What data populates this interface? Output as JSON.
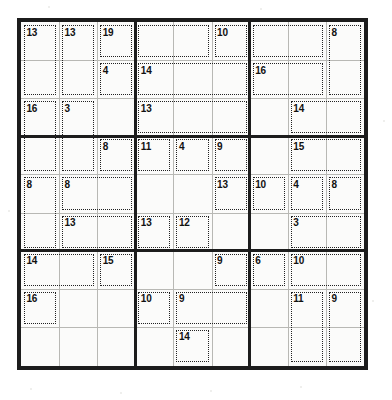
{
  "puzzle": {
    "type": "killer-sudoku",
    "title": "Killer Sudoku",
    "grid_size": 9,
    "box_size": 3,
    "cells_filled": [],
    "geometry": {
      "origin_x": 17,
      "origin_y": 18,
      "grid_px": 351,
      "cell_px": 38.6
    },
    "colors": {
      "border": "#1c1c1c",
      "cell_line": "#b8b8b4",
      "cage_line": "#222222",
      "paper": "#fbfbfa",
      "text": "#111111"
    },
    "cages": [
      {
        "sum": "13",
        "anchor": [
          0,
          0
        ],
        "cells": [
          [
            0,
            0
          ],
          [
            1,
            0
          ]
        ]
      },
      {
        "sum": "13",
        "anchor": [
          0,
          1
        ],
        "cells": [
          [
            0,
            1
          ],
          [
            1,
            1
          ]
        ]
      },
      {
        "sum": "19",
        "anchor": [
          0,
          2
        ],
        "cells": [
          [
            0,
            2
          ]
        ]
      },
      {
        "sum": "10",
        "anchor": [
          0,
          5
        ],
        "cells": [
          [
            0,
            5
          ],
          [
            0,
            6
          ],
          [
            0,
            7
          ]
        ]
      },
      {
        "sum": "8",
        "anchor": [
          0,
          8
        ],
        "cells": [
          [
            0,
            8
          ],
          [
            1,
            8
          ]
        ]
      },
      {
        "sum": "4",
        "anchor": [
          1,
          2
        ],
        "cells": [
          [
            1,
            2
          ],
          [
            1,
            3
          ],
          [
            1,
            4
          ]
        ]
      },
      {
        "sum": "14",
        "anchor": [
          1,
          3
        ],
        "cells": [
          [
            1,
            3
          ],
          [
            1,
            4
          ],
          [
            1,
            5
          ]
        ]
      },
      {
        "sum": "16",
        "anchor": [
          1,
          6
        ],
        "cells": [
          [
            1,
            6
          ],
          [
            1,
            7
          ],
          [
            2,
            6
          ]
        ]
      },
      {
        "sum": "16",
        "anchor": [
          2,
          0
        ],
        "cells": [
          [
            2,
            0
          ],
          [
            3,
            0
          ]
        ]
      },
      {
        "sum": "3",
        "anchor": [
          2,
          1
        ],
        "cells": [
          [
            2,
            1
          ],
          [
            3,
            1
          ]
        ]
      },
      {
        "sum": "13",
        "anchor": [
          2,
          3
        ],
        "cells": [
          [
            2,
            3
          ],
          [
            2,
            4
          ],
          [
            2,
            5
          ]
        ]
      },
      {
        "sum": "14",
        "anchor": [
          2,
          7
        ],
        "cells": [
          [
            2,
            7
          ],
          [
            2,
            8
          ]
        ]
      },
      {
        "sum": "8",
        "anchor": [
          3,
          2
        ],
        "cells": [
          [
            3,
            2
          ]
        ]
      },
      {
        "sum": "11",
        "anchor": [
          3,
          3
        ],
        "cells": [
          [
            3,
            3
          ],
          [
            3,
            4
          ]
        ]
      },
      {
        "sum": "4",
        "anchor": [
          3,
          4
        ],
        "cells": [
          [
            3,
            4
          ]
        ]
      },
      {
        "sum": "9",
        "anchor": [
          3,
          5
        ],
        "cells": [
          [
            3,
            5
          ],
          [
            3,
            6
          ]
        ]
      },
      {
        "sum": "15",
        "anchor": [
          3,
          7
        ],
        "cells": [
          [
            3,
            7
          ],
          [
            3,
            8
          ]
        ]
      },
      {
        "sum": "8",
        "anchor": [
          4,
          0
        ],
        "cells": [
          [
            4,
            0
          ],
          [
            5,
            0
          ]
        ]
      },
      {
        "sum": "8",
        "anchor": [
          4,
          1
        ],
        "cells": [
          [
            4,
            1
          ],
          [
            4,
            2
          ]
        ]
      },
      {
        "sum": "13",
        "anchor": [
          4,
          5
        ],
        "cells": [
          [
            4,
            5
          ],
          [
            5,
            5
          ]
        ]
      },
      {
        "sum": "10",
        "anchor": [
          4,
          6
        ],
        "cells": [
          [
            4,
            6
          ],
          [
            5,
            6
          ]
        ]
      },
      {
        "sum": "4",
        "anchor": [
          4,
          7
        ],
        "cells": [
          [
            4,
            7
          ]
        ]
      },
      {
        "sum": "8",
        "anchor": [
          4,
          8
        ],
        "cells": [
          [
            4,
            8
          ]
        ]
      },
      {
        "sum": "13",
        "anchor": [
          5,
          1
        ],
        "cells": [
          [
            5,
            1
          ],
          [
            5,
            2
          ]
        ]
      },
      {
        "sum": "13",
        "anchor": [
          5,
          3
        ],
        "cells": [
          [
            5,
            3
          ],
          [
            5,
            4
          ]
        ]
      },
      {
        "sum": "12",
        "anchor": [
          5,
          4
        ],
        "cells": [
          [
            5,
            4
          ]
        ]
      },
      {
        "sum": "3",
        "anchor": [
          5,
          7
        ],
        "cells": [
          [
            5,
            7
          ],
          [
            5,
            8
          ]
        ]
      },
      {
        "sum": "14",
        "anchor": [
          6,
          0
        ],
        "cells": [
          [
            6,
            0
          ],
          [
            6,
            1
          ]
        ]
      },
      {
        "sum": "15",
        "anchor": [
          6,
          2
        ],
        "cells": [
          [
            6,
            2
          ],
          [
            7,
            2
          ]
        ]
      },
      {
        "sum": "9",
        "anchor": [
          6,
          5
        ],
        "cells": [
          [
            6,
            5
          ]
        ]
      },
      {
        "sum": "6",
        "anchor": [
          6,
          6
        ],
        "cells": [
          [
            6,
            6
          ],
          [
            7,
            6
          ]
        ]
      },
      {
        "sum": "10",
        "anchor": [
          6,
          7
        ],
        "cells": [
          [
            6,
            7
          ],
          [
            6,
            8
          ]
        ]
      },
      {
        "sum": "16",
        "anchor": [
          7,
          0
        ],
        "cells": [
          [
            7,
            0
          ],
          [
            8,
            0
          ]
        ]
      },
      {
        "sum": "10",
        "anchor": [
          7,
          3
        ],
        "cells": [
          [
            7,
            3
          ]
        ]
      },
      {
        "sum": "9",
        "anchor": [
          7,
          4
        ],
        "cells": [
          [
            7,
            4
          ],
          [
            7,
            5
          ]
        ]
      },
      {
        "sum": "11",
        "anchor": [
          7,
          7
        ],
        "cells": [
          [
            7,
            7
          ],
          [
            8,
            7
          ]
        ]
      },
      {
        "sum": "9",
        "anchor": [
          7,
          8
        ],
        "cells": [
          [
            7,
            8
          ],
          [
            8,
            8
          ]
        ]
      },
      {
        "sum": "14",
        "anchor": [
          8,
          4
        ],
        "cells": [
          [
            8,
            4
          ]
        ]
      }
    ],
    "cage_rects": [
      {
        "sum": "13",
        "r": 0,
        "c": 0,
        "rs": 2,
        "cs": 1
      },
      {
        "sum": "13",
        "r": 0,
        "c": 1,
        "rs": 2,
        "cs": 1
      },
      {
        "sum": "19",
        "r": 0,
        "c": 2,
        "rs": 1,
        "cs": 1
      },
      {
        "sum": "10",
        "r": 0,
        "c": 5,
        "rs": 1,
        "cs": 1
      },
      {
        "sum": "",
        "r": 0,
        "c": 3,
        "rs": 1,
        "cs": 2
      },
      {
        "sum": "",
        "r": 0,
        "c": 6,
        "rs": 1,
        "cs": 2
      },
      {
        "sum": "8",
        "r": 0,
        "c": 8,
        "rs": 2,
        "cs": 1
      },
      {
        "sum": "4",
        "r": 1,
        "c": 2,
        "rs": 1,
        "cs": 1
      },
      {
        "sum": "14",
        "r": 1,
        "c": 3,
        "rs": 1,
        "cs": 3
      },
      {
        "sum": "16",
        "r": 1,
        "c": 6,
        "rs": 1,
        "cs": 2
      },
      {
        "sum": "16",
        "r": 2,
        "c": 0,
        "rs": 2,
        "cs": 1
      },
      {
        "sum": "3",
        "r": 2,
        "c": 1,
        "rs": 2,
        "cs": 1
      },
      {
        "sum": "13",
        "r": 2,
        "c": 3,
        "rs": 1,
        "cs": 3
      },
      {
        "sum": "14",
        "r": 2,
        "c": 7,
        "rs": 1,
        "cs": 2
      },
      {
        "sum": "8",
        "r": 3,
        "c": 2,
        "rs": 1,
        "cs": 1
      },
      {
        "sum": "11",
        "r": 3,
        "c": 3,
        "rs": 1,
        "cs": 1
      },
      {
        "sum": "4",
        "r": 3,
        "c": 4,
        "rs": 1,
        "cs": 1
      },
      {
        "sum": "9",
        "r": 3,
        "c": 5,
        "rs": 1,
        "cs": 1
      },
      {
        "sum": "15",
        "r": 3,
        "c": 7,
        "rs": 1,
        "cs": 2
      },
      {
        "sum": "8",
        "r": 4,
        "c": 0,
        "rs": 2,
        "cs": 1
      },
      {
        "sum": "8",
        "r": 4,
        "c": 1,
        "rs": 1,
        "cs": 2
      },
      {
        "sum": "13",
        "r": 4,
        "c": 5,
        "rs": 1,
        "cs": 1
      },
      {
        "sum": "10",
        "r": 4,
        "c": 6,
        "rs": 1,
        "cs": 1
      },
      {
        "sum": "4",
        "r": 4,
        "c": 7,
        "rs": 1,
        "cs": 1
      },
      {
        "sum": "8",
        "r": 4,
        "c": 8,
        "rs": 1,
        "cs": 1
      },
      {
        "sum": "13",
        "r": 5,
        "c": 1,
        "rs": 1,
        "cs": 2
      },
      {
        "sum": "13",
        "r": 5,
        "c": 3,
        "rs": 1,
        "cs": 1
      },
      {
        "sum": "12",
        "r": 5,
        "c": 4,
        "rs": 1,
        "cs": 1
      },
      {
        "sum": "3",
        "r": 5,
        "c": 7,
        "rs": 1,
        "cs": 2
      },
      {
        "sum": "14",
        "r": 6,
        "c": 0,
        "rs": 1,
        "cs": 2
      },
      {
        "sum": "15",
        "r": 6,
        "c": 2,
        "rs": 1,
        "cs": 1
      },
      {
        "sum": "9",
        "r": 6,
        "c": 5,
        "rs": 1,
        "cs": 1
      },
      {
        "sum": "6",
        "r": 6,
        "c": 6,
        "rs": 1,
        "cs": 1
      },
      {
        "sum": "10",
        "r": 6,
        "c": 7,
        "rs": 1,
        "cs": 2
      },
      {
        "sum": "16",
        "r": 7,
        "c": 0,
        "rs": 1,
        "cs": 1
      },
      {
        "sum": "10",
        "r": 7,
        "c": 3,
        "rs": 1,
        "cs": 1
      },
      {
        "sum": "9",
        "r": 7,
        "c": 4,
        "rs": 1,
        "cs": 2
      },
      {
        "sum": "11",
        "r": 7,
        "c": 7,
        "rs": 2,
        "cs": 1
      },
      {
        "sum": "9",
        "r": 7,
        "c": 8,
        "rs": 2,
        "cs": 1
      },
      {
        "sum": "14",
        "r": 8,
        "c": 4,
        "rs": 1,
        "cs": 1
      }
    ],
    "sum_labels": [
      {
        "t": "13",
        "r": 0,
        "c": 0
      },
      {
        "t": "13",
        "r": 0,
        "c": 1
      },
      {
        "t": "19",
        "r": 0,
        "c": 2
      },
      {
        "t": "10",
        "r": 0,
        "c": 5
      },
      {
        "t": "8",
        "r": 0,
        "c": 8
      },
      {
        "t": "4",
        "r": 1,
        "c": 2
      },
      {
        "t": "14",
        "r": 1,
        "c": 3
      },
      {
        "t": "16",
        "r": 1,
        "c": 6
      },
      {
        "t": "16",
        "r": 2,
        "c": 0
      },
      {
        "t": "3",
        "r": 2,
        "c": 1
      },
      {
        "t": "13",
        "r": 2,
        "c": 3
      },
      {
        "t": "14",
        "r": 2,
        "c": 7
      },
      {
        "t": "8",
        "r": 3,
        "c": 2
      },
      {
        "t": "11",
        "r": 3,
        "c": 3
      },
      {
        "t": "4",
        "r": 3,
        "c": 4
      },
      {
        "t": "9",
        "r": 3,
        "c": 5
      },
      {
        "t": "15",
        "r": 3,
        "c": 7
      },
      {
        "t": "8",
        "r": 4,
        "c": 0
      },
      {
        "t": "8",
        "r": 4,
        "c": 1
      },
      {
        "t": "13",
        "r": 4,
        "c": 5
      },
      {
        "t": "10",
        "r": 4,
        "c": 6
      },
      {
        "t": "4",
        "r": 4,
        "c": 7
      },
      {
        "t": "8",
        "r": 4,
        "c": 8
      },
      {
        "t": "13",
        "r": 5,
        "c": 1
      },
      {
        "t": "13",
        "r": 5,
        "c": 3
      },
      {
        "t": "12",
        "r": 5,
        "c": 4
      },
      {
        "t": "3",
        "r": 5,
        "c": 7
      },
      {
        "t": "14",
        "r": 6,
        "c": 0
      },
      {
        "t": "15",
        "r": 6,
        "c": 2
      },
      {
        "t": "9",
        "r": 6,
        "c": 5
      },
      {
        "t": "6",
        "r": 6,
        "c": 6
      },
      {
        "t": "10",
        "r": 6,
        "c": 7
      },
      {
        "t": "16",
        "r": 7,
        "c": 0
      },
      {
        "t": "10",
        "r": 7,
        "c": 3
      },
      {
        "t": "9",
        "r": 7,
        "c": 4
      },
      {
        "t": "11",
        "r": 7,
        "c": 7
      },
      {
        "t": "9",
        "r": 7,
        "c": 8
      },
      {
        "t": "14",
        "r": 8,
        "c": 4
      }
    ]
  }
}
